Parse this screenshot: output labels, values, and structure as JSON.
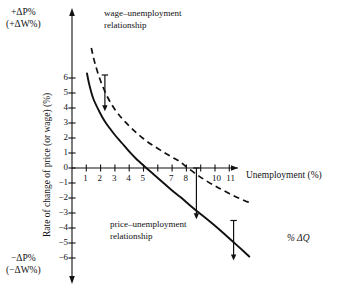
{
  "figure": {
    "kind": "economics-phillips-curve-diagram",
    "background": "#ffffff",
    "ink": "#111111"
  },
  "axes": {
    "x_title": "Unemployment (%)",
    "y_title": "Rate of change of price (or wage) (%)",
    "top_corner_line1": "+ΔP%",
    "top_corner_line2": "(+ΔW%)",
    "bottom_corner_line1": "−ΔP%",
    "bottom_corner_line2": "(−ΔW%)",
    "x_ticks_values": [
      1,
      2,
      3,
      4,
      5,
      6,
      7,
      8,
      9,
      10,
      11
    ],
    "x_tick_labels": [
      "1",
      "2",
      "3",
      "4",
      "5",
      "",
      "7",
      "8",
      "",
      "10",
      "11"
    ],
    "y_ticks_values": [
      6,
      5,
      4,
      3,
      2,
      1,
      0,
      -1,
      -2,
      -3,
      -4,
      -5,
      -6
    ],
    "y_tick_labels": [
      "6",
      "5",
      "4",
      "3",
      "2",
      "1",
      "0",
      "−1",
      "−2",
      "−3",
      "−4",
      "−5",
      "−6"
    ]
  },
  "annotations": {
    "wage_curve_line1": "wage–unemployment",
    "wage_curve_line2": "relationship",
    "price_curve_line1": "price–unemployment",
    "price_curve_line2": "relationship",
    "gap_label": "% ΔQ"
  },
  "chart_data": {
    "type": "line",
    "title": "",
    "xlabel": "Unemployment (%)",
    "ylabel": "Rate of change of price (or wage) (%)",
    "xlim": [
      0,
      12.6
    ],
    "ylim": [
      -7.2,
      8.2
    ],
    "grid": false,
    "legend": "inline-annotations",
    "series": [
      {
        "name": "wage–unemployment relationship",
        "style": "dashed",
        "x": [
          1.35,
          1.6,
          2.0,
          2.5,
          3.0,
          3.5,
          4.0,
          4.5,
          5.0,
          5.5,
          6.0,
          6.5,
          7.0,
          7.5,
          8.1,
          8.7,
          9.3,
          10.0,
          10.6,
          11.3,
          12.0,
          12.4
        ],
        "y": [
          8.0,
          7.0,
          5.8,
          4.7,
          3.9,
          3.3,
          2.8,
          2.35,
          1.95,
          1.6,
          1.3,
          1.0,
          0.72,
          0.45,
          0.0,
          -0.42,
          -0.8,
          -1.2,
          -1.5,
          -1.85,
          -2.15,
          -2.3
        ]
      },
      {
        "name": "price–unemployment relationship",
        "style": "solid",
        "x": [
          1.05,
          1.2,
          1.5,
          2.0,
          2.3,
          2.6,
          3.0,
          3.5,
          4.0,
          4.5,
          5.2,
          5.8,
          6.4,
          7.0,
          7.6,
          8.2,
          8.7,
          9.3,
          10.0,
          10.6,
          11.3,
          12.0,
          12.4
        ],
        "y": [
          6.3,
          5.6,
          4.6,
          3.6,
          3.1,
          2.7,
          2.2,
          1.65,
          1.1,
          0.6,
          0.0,
          -0.5,
          -1.0,
          -1.5,
          -1.95,
          -2.45,
          -2.85,
          -3.3,
          -3.85,
          -4.35,
          -4.95,
          -5.55,
          -5.9
        ]
      }
    ],
    "gap_arrows": [
      {
        "x": 2.3,
        "y_from": 6.2,
        "y_to": 3.85,
        "label": ""
      },
      {
        "x": 8.7,
        "y_from": 0.0,
        "y_to": -3.35,
        "label": ""
      },
      {
        "x": 11.3,
        "y_from": -3.5,
        "y_to": -6.1,
        "label": "% ΔQ"
      }
    ],
    "annotation_note": "vertical arrows measure the productivity growth gap %ΔQ between the wage and price curves"
  }
}
